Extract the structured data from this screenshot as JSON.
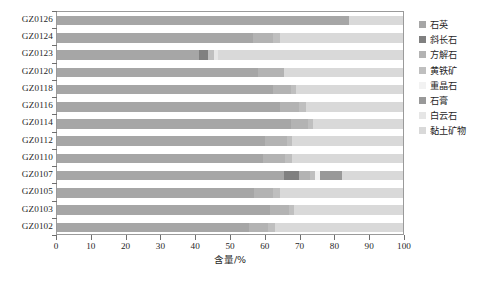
{
  "chart_data": {
    "type": "bar",
    "orientation": "horizontal",
    "stacked": true,
    "title": "",
    "xlabel": "含量/%",
    "ylabel": "",
    "xlim": [
      0,
      100
    ],
    "xticks": [
      0,
      10,
      20,
      30,
      40,
      50,
      60,
      70,
      80,
      90,
      100
    ],
    "xtick_labels": [
      "0",
      "10",
      "20",
      "30",
      "40",
      "50",
      "60",
      "70",
      "80",
      "90",
      "100"
    ],
    "grid": false,
    "legend_position": "right",
    "categories": [
      "GZ0126",
      "GZ0124",
      "GZ0123",
      "GZ0120",
      "GZ0118",
      "GZ0116",
      "GZ0114",
      "GZ0112",
      "GZ0110",
      "GZ0107",
      "GZ0105",
      "GZ0103",
      "GZ0102"
    ],
    "series": [
      {
        "name": "石英",
        "color": "#a6a6a6",
        "values": [
          84.5,
          56.5,
          41.0,
          58.0,
          62.5,
          64.5,
          67.5,
          60.0,
          59.5,
          65.5,
          57.0,
          61.5,
          55.5
        ]
      },
      {
        "name": "斜长石",
        "color": "#808080",
        "values": [
          0.0,
          0.0,
          2.5,
          0.0,
          0.0,
          0.0,
          0.0,
          0.0,
          0.0,
          4.5,
          0.0,
          0.0,
          0.0
        ]
      },
      {
        "name": "方解石",
        "color": "#b3b3b3",
        "values": [
          0.0,
          6.0,
          0.0,
          7.5,
          5.0,
          5.5,
          5.0,
          6.5,
          6.5,
          3.0,
          5.5,
          5.5,
          5.5
        ]
      },
      {
        "name": "黄铁矿",
        "color": "#bfbfbf",
        "values": [
          0.0,
          2.0,
          2.0,
          0.0,
          1.5,
          2.0,
          1.5,
          1.5,
          2.0,
          1.5,
          2.0,
          1.5,
          2.0
        ]
      },
      {
        "name": "重晶石",
        "color": "#f2f2f2",
        "values": [
          0.0,
          0.0,
          0.0,
          0.0,
          0.0,
          0.0,
          0.0,
          0.0,
          0.0,
          1.5,
          0.0,
          0.0,
          0.0
        ]
      },
      {
        "name": "石膏",
        "color": "#999999",
        "values": [
          0.0,
          0.0,
          0.0,
          0.0,
          0.0,
          0.0,
          0.0,
          0.0,
          0.0,
          6.5,
          0.0,
          0.0,
          0.0
        ]
      },
      {
        "name": "白云石",
        "color": "#e6e6e6",
        "values": [
          0.0,
          0.0,
          1.0,
          0.0,
          0.0,
          0.0,
          0.0,
          0.0,
          0.0,
          0.0,
          0.0,
          0.0,
          0.0
        ]
      },
      {
        "name": "黏土矿物",
        "color": "#d9d9d9",
        "values": [
          15.5,
          35.5,
          53.5,
          34.5,
          31.0,
          28.0,
          26.0,
          32.0,
          32.0,
          17.5,
          35.5,
          31.5,
          37.0
        ]
      }
    ]
  }
}
